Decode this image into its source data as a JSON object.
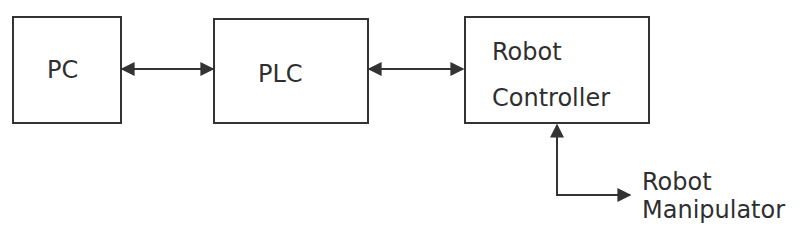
{
  "diagram": {
    "nodes": [
      {
        "id": "pc",
        "label": "PC"
      },
      {
        "id": "plc",
        "label": "PLC"
      },
      {
        "id": "robot_controller",
        "label_line1": "Robot",
        "label_line2": "Controller"
      },
      {
        "id": "robot_manipulator",
        "label_line1": "Robot",
        "label_line2": "Manipulator"
      }
    ],
    "edges": [
      {
        "from": "pc",
        "to": "plc",
        "type": "bidirectional"
      },
      {
        "from": "plc",
        "to": "robot_controller",
        "type": "bidirectional"
      },
      {
        "from": "robot_controller",
        "to": "robot_manipulator",
        "type": "bidirectional"
      }
    ],
    "colors": {
      "line": "#333333",
      "text": "#2f2f2f",
      "background": "#ffffff"
    }
  }
}
